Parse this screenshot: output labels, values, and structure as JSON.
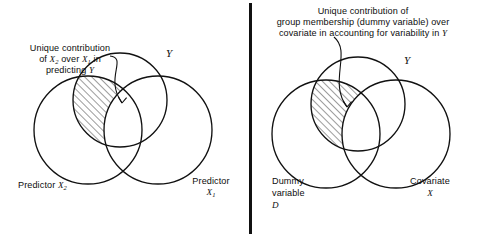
{
  "figure": {
    "type": "venn-diagram-pair",
    "background": "#ffffff",
    "ink_color": "#111111",
    "hatch_color": "#222222",
    "divider": {
      "name": "panel-divider",
      "x": 250,
      "y_top": 3,
      "y_bottom": 234,
      "width": 3
    }
  },
  "left_panel": {
    "caption": {
      "line1": "Unique contribution",
      "line2_a": "of ",
      "line2_x2": "X",
      "line2_x2_sub": "2",
      "line2_b": " over ",
      "line2_x1": "X",
      "line2_x1_sub": "1",
      "line2_c": " in",
      "line3_a": "predicting ",
      "line3_y": "Y"
    },
    "circle_labels": {
      "y": "Y",
      "predictor_x2_text": "Predictor ",
      "predictor_x2_var": "X",
      "predictor_x2_sub": "2",
      "predictor_x1_text": "Predictor",
      "predictor_x1_var": "X",
      "predictor_x1_sub": "1"
    },
    "circles": [
      {
        "name": "circle-y",
        "cx": 120,
        "cy": 100,
        "r": 47
      },
      {
        "name": "circle-predictor-x2",
        "cx": 88,
        "cy": 130,
        "r": 54
      },
      {
        "name": "circle-predictor-x1",
        "cx": 158,
        "cy": 130,
        "r": 54
      }
    ],
    "shaded_region": "intersection of Y and Predictor X2 excluding Predictor X1",
    "arrow": {
      "name": "caption-arrow-left",
      "from": [
        112,
        57
      ],
      "to": [
        124,
        106
      ]
    }
  },
  "right_panel": {
    "caption": {
      "line1": "Unique contribution of",
      "line2": "group membership (dummy variable) over",
      "line3_a": "covariate in accounting for variability in ",
      "line3_y": "Y"
    },
    "circle_labels": {
      "y": "Y",
      "dummy_line1": "Dummy",
      "dummy_line2": "variable",
      "dummy_var": "D",
      "covariate_text": "Covariate",
      "covariate_var": "X"
    },
    "circles": [
      {
        "name": "circle-y",
        "cx": 358,
        "cy": 104,
        "r": 47
      },
      {
        "name": "circle-dummy-d",
        "cx": 326,
        "cy": 134,
        "r": 54
      },
      {
        "name": "circle-covariate-x",
        "cx": 396,
        "cy": 134,
        "r": 54
      }
    ],
    "shaded_region": "intersection of Y and Dummy variable D excluding Covariate X",
    "arrow": {
      "name": "caption-arrow-right",
      "from": [
        336,
        38
      ],
      "to": [
        348,
        110
      ]
    }
  }
}
